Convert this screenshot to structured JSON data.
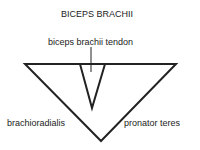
{
  "title": "BICEPS BRACHII",
  "labels": {
    "tendon": "biceps brachii tendon",
    "left": "brachioradialis",
    "right": "pronator teres"
  },
  "colors": {
    "line": "#222222",
    "background": "#ffffff"
  }
}
